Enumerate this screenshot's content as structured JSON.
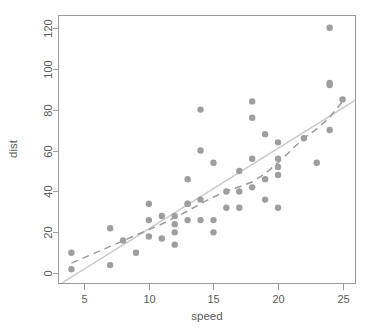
{
  "chart_data": {
    "type": "scatter",
    "title": "",
    "xlabel": "speed",
    "ylabel": "dist",
    "xlim": [
      3.0,
      26.0
    ],
    "ylim": [
      -5.0,
      126.0
    ],
    "grid": false,
    "legend": "none",
    "point_color": "#9e9e9e",
    "regression_line_color": "#c8c8c8",
    "lowess_line_color": "#9a9a9a",
    "axis_color": "#9a9a9a",
    "xticks": [
      5,
      10,
      15,
      20,
      25
    ],
    "xtick_labels": [
      "5",
      "10",
      "15",
      "20",
      "25"
    ],
    "yticks": [
      0,
      20,
      40,
      60,
      80,
      100,
      120
    ],
    "ytick_labels": [
      "0",
      "20",
      "40",
      "60",
      "80",
      "100",
      "120"
    ],
    "x": [
      4,
      4,
      7,
      7,
      8,
      9,
      10,
      10,
      10,
      11,
      11,
      12,
      12,
      12,
      12,
      13,
      13,
      13,
      13,
      14,
      14,
      14,
      14,
      15,
      15,
      15,
      16,
      16,
      17,
      17,
      17,
      18,
      18,
      18,
      18,
      19,
      19,
      19,
      20,
      20,
      20,
      20,
      20,
      22,
      23,
      24,
      24,
      24,
      24,
      25
    ],
    "y": [
      2,
      10,
      4,
      22,
      16,
      10,
      18,
      26,
      34,
      17,
      28,
      14,
      20,
      24,
      28,
      26,
      34,
      34,
      46,
      26,
      36,
      60,
      80,
      20,
      26,
      54,
      32,
      40,
      32,
      40,
      50,
      42,
      56,
      76,
      84,
      36,
      46,
      68,
      32,
      48,
      52,
      56,
      64,
      66,
      54,
      70,
      92,
      93,
      120,
      85
    ],
    "series": [
      {
        "name": "cars observations",
        "type": "scatter",
        "n_points": 50
      },
      {
        "name": "linear regression",
        "type": "line",
        "style": "solid",
        "intercept": -17.5791,
        "slope": 3.9324,
        "endpoints": [
          [
            3.0,
            -5.78
          ],
          [
            26.0,
            84.66
          ]
        ]
      },
      {
        "name": "lowess smoother",
        "type": "line",
        "style": "dashed",
        "points": [
          [
            4,
            4.97
          ],
          [
            7,
            13.12
          ],
          [
            8,
            15.86
          ],
          [
            9,
            18.6
          ],
          [
            10,
            21.35
          ],
          [
            11,
            24.09
          ],
          [
            12,
            27.21
          ],
          [
            13,
            30.42
          ],
          [
            14,
            34.01
          ],
          [
            15,
            37.24
          ],
          [
            16,
            40.18
          ],
          [
            17,
            42.27
          ],
          [
            18,
            44.6
          ],
          [
            19,
            48.68
          ],
          [
            20,
            54.05
          ],
          [
            22,
            66.04
          ],
          [
            23,
            70.54
          ],
          [
            24,
            76.17
          ],
          [
            25,
            84.0
          ]
        ]
      }
    ]
  },
  "axes": {
    "x_title": "speed",
    "y_title": "dist"
  }
}
